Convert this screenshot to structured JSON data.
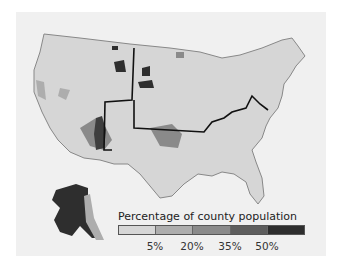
{
  "map": {
    "subject": "Percentage of county population by US county",
    "regions": [
      "contiguous-united-states",
      "alaska"
    ],
    "highlighted_boundary": "bold line tracing Oklahoma/Kansas and Kentucky-Ohio River boundaries plus New Mexico/Texas border"
  },
  "legend": {
    "title": "Percentage of county population",
    "classes": [
      {
        "label": "0-5%",
        "color": "#d6d6d6"
      },
      {
        "label": "5-20%",
        "color": "#adadad"
      },
      {
        "label": "20-35%",
        "color": "#8a8a8a"
      },
      {
        "label": "35-50%",
        "color": "#5e5e5e"
      },
      {
        "label": ">50%",
        "color": "#2e2e2e"
      }
    ],
    "ticks": [
      "5%",
      "20%",
      "35%",
      "50%"
    ]
  },
  "colors": {
    "background": "#f0f0f0",
    "land": "#d6d6d6",
    "state_border": "#333333"
  }
}
